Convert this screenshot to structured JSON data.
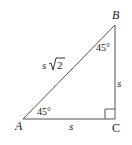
{
  "diagram": {
    "type": "right isosceles triangle (45-45-90)",
    "vertices": {
      "A": {
        "label": "A"
      },
      "B": {
        "label": "B"
      },
      "C": {
        "label": "C"
      }
    },
    "sides": {
      "AC": {
        "label": "s"
      },
      "BC": {
        "label": "s"
      },
      "AB": {
        "label_base": "s",
        "label_radical": "2"
      }
    },
    "angles": {
      "A": {
        "label": "45°"
      },
      "B": {
        "label": "45°"
      },
      "C": {
        "marker": "right-angle-square"
      }
    },
    "colors": {
      "stroke": "#555555",
      "text": "#1a1a1a",
      "background": "#ffffff"
    }
  }
}
